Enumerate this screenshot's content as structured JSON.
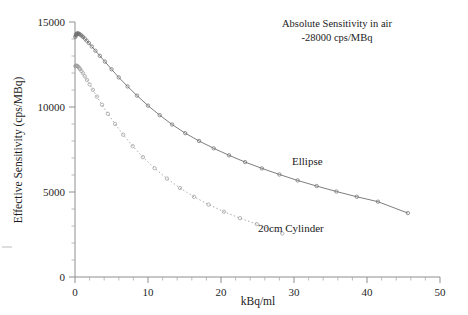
{
  "chart_data": {
    "type": "line",
    "title": "",
    "xlabel": "kBq/ml",
    "ylabel": "Effective Sensitivity (cps/MBq)",
    "xlim": [
      0,
      50
    ],
    "ylim": [
      0,
      15000
    ],
    "xticks": [
      "0",
      "10",
      "20",
      "30",
      "40",
      "50"
    ],
    "xtick_values": [
      0,
      10,
      20,
      30,
      40,
      50
    ],
    "xtick_minor_step": 2,
    "yticks": [
      "0",
      "5000",
      "10000",
      "15000"
    ],
    "ytick_values": [
      0,
      5000,
      10000,
      15000
    ],
    "ytick_minor_step": 1000,
    "grid": false,
    "legend_position": "inline-annotations",
    "annotations": [
      {
        "name": "absolute-sensitivity-note",
        "line1": "Absolute Sensitivity in air",
        "line2": "-28000 cps/MBq"
      }
    ],
    "series": [
      {
        "name": "Ellipse",
        "label": "Ellipse",
        "linestyle": "solid",
        "marker": "open-circle",
        "color": "#6f6f6f",
        "x": [
          0.05,
          0.1,
          0.16,
          0.22,
          0.3,
          0.38,
          0.48,
          0.6,
          0.75,
          0.92,
          1.1,
          1.35,
          1.6,
          1.9,
          2.3,
          2.8,
          3.4,
          4.1,
          5.0,
          6.0,
          7.2,
          8.5,
          10.0,
          11.6,
          13.3,
          15.1,
          17.0,
          19.0,
          21.1,
          23.3,
          25.6,
          28.0,
          30.5,
          33.1,
          35.8,
          38.6,
          41.5,
          45.6
        ],
        "y": [
          14120,
          14200,
          14260,
          14300,
          14320,
          14330,
          14320,
          14290,
          14250,
          14190,
          14120,
          14020,
          13900,
          13760,
          13560,
          13310,
          13010,
          12670,
          12220,
          11740,
          11210,
          10670,
          10080,
          9520,
          8970,
          8460,
          8000,
          7570,
          7160,
          6760,
          6390,
          6030,
          5680,
          5350,
          5030,
          4720,
          4430,
          3760
        ]
      },
      {
        "name": "20cm Cylinder",
        "label": "20cm Cylinder",
        "linestyle": "dotted",
        "marker": "open-circle",
        "color": "#9a9a9a",
        "x": [
          0.05,
          0.12,
          0.2,
          0.3,
          0.42,
          0.55,
          0.7,
          0.88,
          1.1,
          1.35,
          1.65,
          2.0,
          2.45,
          3.0,
          3.7,
          4.5,
          5.5,
          6.6,
          7.9,
          9.3,
          10.9,
          12.6,
          14.4,
          16.3,
          18.3,
          20.4,
          22.6,
          24.9,
          28.4
        ],
        "y": [
          12400,
          12430,
          12430,
          12410,
          12370,
          12310,
          12230,
          12120,
          11980,
          11800,
          11590,
          11330,
          11010,
          10610,
          10130,
          9600,
          9000,
          8370,
          7700,
          7050,
          6400,
          5790,
          5230,
          4720,
          4260,
          3840,
          3460,
          3110,
          2560
        ]
      }
    ],
    "series_labels": [
      {
        "name": "ellipse-curve-label",
        "text": "Ellipse"
      },
      {
        "name": "cylinder-curve-label",
        "text": "20cm Cylinder"
      }
    ]
  }
}
